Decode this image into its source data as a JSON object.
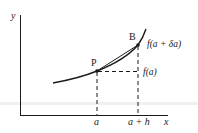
{
  "diagram": {
    "colors": {
      "background": "#ffffff",
      "ink": "#1a1a1a",
      "scan_band": "#eeeeee"
    },
    "axes": {
      "y_label": "y",
      "x_label": "x"
    },
    "points": {
      "P": {
        "label": "P",
        "value_label": "f(a)",
        "x_label": "a"
      },
      "B": {
        "label": "B",
        "value_label": "f(a + δa)",
        "x_label": "a + h"
      }
    },
    "elements": [
      "curve",
      "chord P–B",
      "dashed vertical from P",
      "dashed vertical from B",
      "dashed horizontal from P to B's vertical"
    ]
  }
}
